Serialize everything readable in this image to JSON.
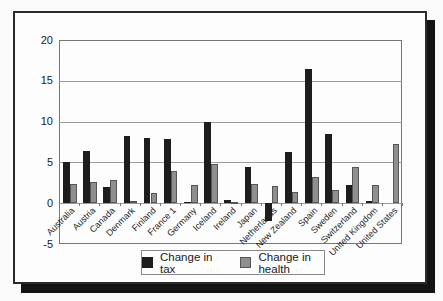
{
  "figure": {
    "background": "#fbfbfb",
    "frame_border_color": "#2b2b2b",
    "shadow_color": "#141414",
    "gridline_color": "#9c9c9c"
  },
  "chart_data": {
    "type": "bar",
    "title": "",
    "xlabel": "",
    "ylabel": "",
    "categories": [
      "Australia",
      "Austria",
      "Canada",
      "Denmark",
      "Finland",
      "France 1",
      "Germany",
      "Iceland",
      "Ireland",
      "Japan",
      "Netherlands",
      "New Zealand",
      "Spain",
      "Sweden",
      "Switzerland",
      "United Kingdom",
      "United States"
    ],
    "series": [
      {
        "name": "Change in tax",
        "color": "#1d1d1d",
        "values": [
          5.1,
          6.4,
          2.0,
          8.2,
          8.0,
          7.9,
          0.2,
          9.9,
          0.4,
          4.4,
          -2.2,
          6.3,
          16.4,
          8.5,
          2.2,
          0.3,
          0.0
        ]
      },
      {
        "name": "Change in health",
        "color": "#8f8f8f",
        "values": [
          2.4,
          2.6,
          2.8,
          0.3,
          1.2,
          3.9,
          2.2,
          4.8,
          0.1,
          2.3,
          2.1,
          1.4,
          3.2,
          1.6,
          4.4,
          2.2,
          7.2
        ]
      }
    ],
    "ylim": [
      -5,
      20
    ],
    "yticks": [
      20,
      15,
      10,
      5,
      0,
      -5
    ],
    "grid": true,
    "legend_position": "bottom"
  }
}
